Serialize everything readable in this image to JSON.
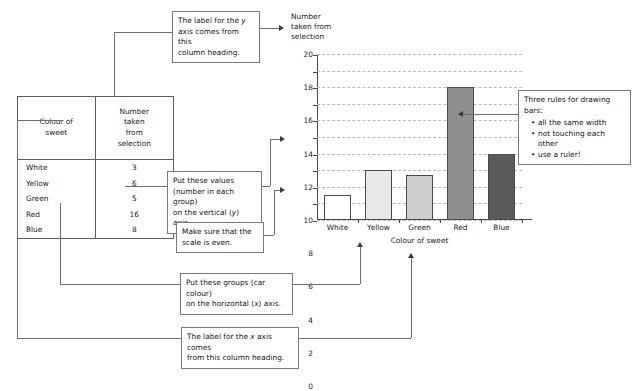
{
  "table": {
    "headers": [
      "Colour of sweet",
      "Number taken from selection"
    ],
    "header_lines": [
      [
        "Colour of",
        "sweet"
      ],
      [
        "Number",
        "taken",
        "from",
        "selection"
      ]
    ],
    "rows": [
      {
        "colour": "White",
        "count": "3"
      },
      {
        "colour": "Yellow",
        "count": "6"
      },
      {
        "colour": "Green",
        "count": "5"
      },
      {
        "colour": "Red",
        "count": "16"
      },
      {
        "colour": "Blue",
        "count": "8"
      }
    ]
  },
  "callouts": {
    "y_label": {
      "line1": "The label for the y",
      "line2": "axis comes from this",
      "line3": "column heading."
    },
    "values": {
      "line1": "Put these values",
      "line2": "(number in each group)",
      "line3": "on the vertical (y) axis."
    },
    "scale": {
      "line1": "Make sure that the",
      "line2": "scale is even."
    },
    "groups": {
      "line1": "Put these groups (car colour)",
      "line2": "on the horizontal (x) axis."
    },
    "x_label": {
      "line1": "The label for the x axis comes",
      "line2": "from this column heading."
    },
    "rules": {
      "title": "Three rules for drawing bars:",
      "items": [
        "all the same width",
        "not touching each other",
        "use a ruler!"
      ]
    }
  },
  "chart_data": {
    "type": "bar",
    "title": "",
    "categories": [
      "White",
      "Yellow",
      "Green",
      "Red",
      "Blue"
    ],
    "values": [
      3,
      6,
      5.4,
      16,
      8
    ],
    "xlabel": "Colour of sweet",
    "ylabel": "Number taken from selection",
    "ylabel_lines": [
      "Number",
      "taken from",
      "selection"
    ],
    "ylim": [
      0,
      20
    ],
    "ytick_step": 2,
    "yticks": [
      0,
      2,
      4,
      6,
      8,
      10,
      12,
      14,
      16,
      18,
      20
    ],
    "grid": true,
    "legend": "none",
    "bar_colors": [
      "#ffffff",
      "#e8e8e8",
      "#cfcfcf",
      "#8f8f8f",
      "#5a5a5a"
    ],
    "bar_edge_color": "#4a4a4a"
  }
}
